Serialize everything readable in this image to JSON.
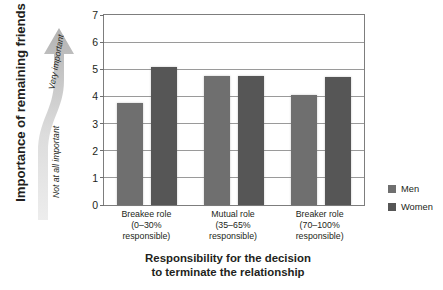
{
  "chart_data": {
    "type": "bar",
    "title": "",
    "categories": [
      "Breakee role (0–30% responsible)",
      "Mutual role (35–65% responsible)",
      "Breaker role (70–100% responsible)"
    ],
    "category_lines": [
      [
        "Breakee role",
        "(0–30%",
        "responsible)"
      ],
      [
        "Mutual role",
        "(35–65%",
        "responsible)"
      ],
      [
        "Breaker role",
        "(70–100%",
        "responsible)"
      ]
    ],
    "series": [
      {
        "name": "Men",
        "values": [
          3.75,
          4.75,
          4.05
        ],
        "color": "#6f6f6f"
      },
      {
        "name": "Women",
        "values": [
          5.1,
          4.75,
          4.7
        ],
        "color": "#565656"
      }
    ],
    "xlabel": "Responsibility for the decision to terminate the relationship",
    "xlabel_lines": [
      "Responsibility for the decision",
      "to terminate the relationship"
    ],
    "ylabel": "Importance of remaining friends",
    "ylim": [
      0,
      7
    ],
    "yticks": [
      "0",
      "1",
      "2",
      "3",
      "4",
      "5",
      "6",
      "7"
    ],
    "grid": true,
    "legend_position": "right"
  },
  "axis_arrow": {
    "top_label": "Very important",
    "bottom_label": "Not at all important"
  },
  "legend": {
    "items": [
      {
        "label": "Men",
        "color": "#6f6f6f"
      },
      {
        "label": "Women",
        "color": "#565656"
      }
    ]
  },
  "colors": {
    "men": "#6f6f6f",
    "women": "#565656",
    "grid": "#9a9a9a",
    "frame": "#7d7d7d",
    "text": "#231f20",
    "arrow_light": "#e6e6e6",
    "arrow_dark": "#b9b9b9"
  }
}
